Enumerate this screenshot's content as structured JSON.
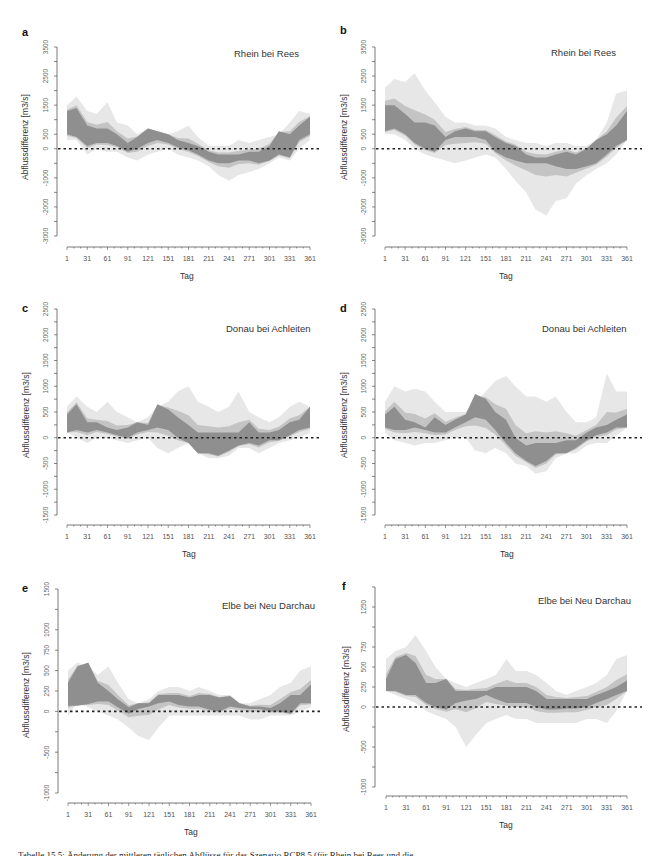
{
  "caption": "Tabelle 15.5: Änderung der mittleren täglichen Abflüsse für das Szenario RCP8.5 (für Rhein bei Rees und die",
  "colors": {
    "light_band": "#e7e7e7",
    "mid_band": "#c4c4c4",
    "dark_band": "#8f8f8f",
    "zero_line": "#222222",
    "axis": "#555555"
  },
  "chart_data": [
    {
      "id": "a",
      "type": "area",
      "title": "Rhein bei Rees",
      "xlabel": "Tag",
      "ylabel": "Abflussdifferenz [m3/s]",
      "xticks": [
        1,
        31,
        61,
        91,
        121,
        151,
        181,
        211,
        241,
        271,
        301,
        331,
        361
      ],
      "yticks": [
        3500,
        2500,
        1500,
        500,
        0,
        -1000,
        -2000,
        -3000
      ],
      "yminor_step": 500,
      "ylim": [
        -3000,
        3500
      ],
      "xlim": [
        1,
        361
      ],
      "reference_line": 0,
      "x": [
        1,
        15,
        31,
        45,
        61,
        75,
        91,
        105,
        121,
        135,
        151,
        165,
        181,
        195,
        211,
        225,
        241,
        255,
        271,
        285,
        301,
        315,
        331,
        345,
        361
      ],
      "light_upper": [
        1500,
        1800,
        1300,
        1200,
        1600,
        900,
        800,
        500,
        700,
        600,
        500,
        600,
        800,
        400,
        100,
        100,
        100,
        300,
        200,
        300,
        400,
        500,
        900,
        1300,
        1200
      ],
      "light_lower": [
        300,
        300,
        -200,
        0,
        -100,
        -100,
        -300,
        -400,
        -200,
        -100,
        0,
        -200,
        -300,
        -400,
        -600,
        -900,
        -1100,
        -900,
        -800,
        -700,
        -500,
        -300,
        -400,
        0,
        300
      ],
      "dark_upper": [
        1300,
        1400,
        800,
        700,
        700,
        500,
        200,
        400,
        700,
        600,
        500,
        300,
        200,
        100,
        -100,
        -200,
        -200,
        -200,
        -100,
        -100,
        100,
        600,
        500,
        800,
        1100
      ],
      "dark_lower": [
        500,
        400,
        100,
        200,
        200,
        100,
        -100,
        0,
        200,
        300,
        200,
        50,
        -50,
        -200,
        -400,
        -500,
        -500,
        -400,
        -400,
        -500,
        -400,
        -200,
        -300,
        300,
        500
      ]
    },
    {
      "id": "b",
      "type": "area",
      "title": "Rhein bei Rees",
      "xlabel": "Tag",
      "ylabel": "Abflussdifferenz [m3/s]",
      "xticks": [
        1,
        31,
        61,
        91,
        121,
        151,
        181,
        211,
        241,
        271,
        301,
        331,
        361
      ],
      "yticks": [
        3500,
        2500,
        1500,
        500,
        0,
        -1000,
        -2000,
        -3000
      ],
      "yminor_step": 500,
      "ylim": [
        -3000,
        3500
      ],
      "xlim": [
        1,
        361
      ],
      "reference_line": 0,
      "x": [
        1,
        15,
        31,
        45,
        61,
        75,
        91,
        105,
        121,
        135,
        151,
        165,
        181,
        195,
        211,
        225,
        241,
        255,
        271,
        285,
        301,
        315,
        331,
        345,
        361
      ],
      "light_upper": [
        2100,
        2400,
        2300,
        2600,
        2000,
        1600,
        1100,
        900,
        900,
        800,
        800,
        700,
        400,
        300,
        200,
        200,
        100,
        200,
        200,
        100,
        100,
        300,
        900,
        1900,
        2000
      ],
      "light_lower": [
        500,
        500,
        300,
        0,
        -200,
        -300,
        -400,
        -500,
        -400,
        -300,
        -200,
        -300,
        -700,
        -1100,
        -1500,
        -2100,
        -2300,
        -1800,
        -1700,
        -1200,
        -900,
        -700,
        -500,
        -200,
        300
      ],
      "dark_upper": [
        1500,
        1500,
        1200,
        900,
        900,
        800,
        400,
        600,
        700,
        600,
        600,
        400,
        200,
        100,
        -200,
        -300,
        -300,
        -200,
        -100,
        -200,
        0,
        300,
        500,
        800,
        1300
      ],
      "dark_lower": [
        600,
        700,
        500,
        200,
        0,
        -100,
        300,
        400,
        400,
        400,
        300,
        -100,
        -300,
        -400,
        -500,
        -500,
        -500,
        -600,
        -700,
        -700,
        -600,
        -500,
        -200,
        100,
        300
      ]
    },
    {
      "id": "c",
      "type": "area",
      "title": "Donau bei Achleiten",
      "xlabel": "Tag",
      "ylabel": "Abflussdifferenz [m3/s]",
      "xticks": [
        1,
        31,
        61,
        91,
        121,
        151,
        181,
        211,
        241,
        271,
        301,
        331,
        361
      ],
      "yticks": [
        2500,
        2000,
        1500,
        1000,
        500,
        0,
        -500,
        -1000,
        -1500
      ],
      "yminor_step": 250,
      "ylim": [
        -1500,
        2500
      ],
      "xlim": [
        1,
        361
      ],
      "reference_line": 0,
      "x": [
        1,
        15,
        31,
        45,
        61,
        75,
        91,
        105,
        121,
        135,
        151,
        165,
        181,
        195,
        211,
        225,
        241,
        255,
        271,
        285,
        301,
        315,
        331,
        345,
        361
      ],
      "light_upper": [
        600,
        800,
        600,
        500,
        700,
        500,
        400,
        300,
        400,
        600,
        700,
        900,
        1000,
        700,
        600,
        500,
        600,
        900,
        500,
        400,
        300,
        400,
        600,
        700,
        600
      ],
      "light_lower": [
        100,
        0,
        -100,
        0,
        0,
        -50,
        -100,
        -50,
        0,
        -200,
        -300,
        -200,
        -100,
        -300,
        -400,
        -400,
        -350,
        -200,
        -200,
        -300,
        -200,
        -100,
        -50,
        0,
        100
      ],
      "dark_upper": [
        450,
        650,
        300,
        300,
        200,
        150,
        200,
        300,
        250,
        650,
        550,
        400,
        250,
        100,
        100,
        100,
        100,
        100,
        300,
        100,
        100,
        150,
        300,
        350,
        600
      ],
      "dark_lower": [
        100,
        150,
        100,
        150,
        100,
        50,
        0,
        100,
        150,
        200,
        150,
        0,
        -100,
        -300,
        -300,
        -350,
        -250,
        -150,
        -100,
        -150,
        -50,
        -50,
        50,
        150,
        200
      ]
    },
    {
      "id": "d",
      "type": "area",
      "title": "Donau bei Achleiten",
      "xlabel": "Tag",
      "ylabel": "Abflussdifferenz [m3/s]",
      "xticks": [
        1,
        31,
        61,
        91,
        121,
        151,
        181,
        211,
        241,
        271,
        301,
        331,
        361
      ],
      "yticks": [
        2500,
        2000,
        1500,
        1000,
        500,
        0,
        -500,
        -1000,
        -1500
      ],
      "yminor_step": 250,
      "ylim": [
        -1500,
        2500
      ],
      "xlim": [
        1,
        361
      ],
      "reference_line": 0,
      "x": [
        1,
        15,
        31,
        45,
        61,
        75,
        91,
        105,
        121,
        135,
        151,
        165,
        181,
        195,
        211,
        225,
        241,
        255,
        271,
        285,
        301,
        315,
        331,
        345,
        361
      ],
      "light_upper": [
        700,
        1000,
        900,
        950,
        900,
        700,
        500,
        500,
        500,
        700,
        900,
        1100,
        1200,
        1000,
        800,
        800,
        700,
        800,
        500,
        300,
        300,
        400,
        1250,
        900,
        900
      ],
      "light_lower": [
        100,
        -50,
        -100,
        -150,
        -100,
        -100,
        -50,
        0,
        0,
        -250,
        -300,
        -200,
        -300,
        -500,
        -550,
        -700,
        -650,
        -400,
        -300,
        -300,
        -150,
        -100,
        -100,
        50,
        200
      ],
      "dark_upper": [
        450,
        600,
        350,
        300,
        200,
        400,
        250,
        350,
        450,
        850,
        750,
        500,
        350,
        0,
        -150,
        -100,
        -100,
        -100,
        -50,
        -50,
        100,
        200,
        250,
        350,
        450
      ],
      "dark_lower": [
        200,
        150,
        150,
        200,
        150,
        100,
        100,
        200,
        300,
        400,
        350,
        150,
        -100,
        -300,
        -450,
        -550,
        -450,
        -300,
        -300,
        -200,
        -50,
        50,
        100,
        200,
        200
      ]
    },
    {
      "id": "e",
      "type": "area",
      "title": "Elbe bei Neu Darchau",
      "xlabel": "Tag",
      "ylabel": "Abflussdifferenz [m3/s]",
      "xticks": [
        1,
        31,
        61,
        91,
        121,
        151,
        181,
        211,
        241,
        271,
        301,
        331,
        361
      ],
      "yticks": [
        1500,
        1000,
        750,
        500,
        250,
        0,
        -500,
        -1000
      ],
      "yminor_step": 250,
      "ylim": [
        -1000,
        1500
      ],
      "xlim": [
        1,
        361
      ],
      "reference_line": 0,
      "x": [
        1,
        15,
        31,
        45,
        61,
        75,
        91,
        105,
        121,
        135,
        151,
        165,
        181,
        195,
        211,
        225,
        241,
        255,
        271,
        285,
        301,
        315,
        331,
        345,
        361
      ],
      "light_upper": [
        500,
        600,
        550,
        450,
        550,
        350,
        150,
        100,
        150,
        250,
        300,
        300,
        250,
        300,
        250,
        200,
        200,
        100,
        100,
        150,
        200,
        300,
        350,
        500,
        550
      ],
      "light_lower": [
        -50,
        100,
        50,
        0,
        -50,
        -100,
        -200,
        -300,
        -350,
        -200,
        -50,
        -50,
        -50,
        -50,
        -50,
        -50,
        -50,
        -50,
        -100,
        -100,
        -50,
        -50,
        -50,
        0,
        50
      ],
      "dark_upper": [
        350,
        550,
        600,
        350,
        250,
        150,
        50,
        100,
        100,
        200,
        200,
        200,
        170,
        200,
        200,
        170,
        190,
        100,
        60,
        60,
        40,
        100,
        200,
        200,
        330
      ],
      "dark_lower": [
        70,
        70,
        90,
        120,
        120,
        50,
        -30,
        30,
        60,
        100,
        120,
        80,
        60,
        60,
        20,
        0,
        60,
        40,
        30,
        30,
        0,
        0,
        -30,
        100,
        100
      ]
    },
    {
      "id": "f",
      "type": "area",
      "title": "Elbe bei Neu Darchau",
      "xlabel": "Tag",
      "ylabel": "Abflussdifferenz [m3/s]",
      "xticks": [
        1,
        31,
        61,
        91,
        121,
        151,
        181,
        211,
        241,
        271,
        301,
        331,
        361
      ],
      "yticks": [
        1250,
        750,
        500,
        250,
        0,
        -500,
        -1000
      ],
      "yminor_step": 250,
      "ylim": [
        -1000,
        1500
      ],
      "xlim": [
        1,
        361
      ],
      "reference_line": 0,
      "x": [
        1,
        15,
        31,
        45,
        61,
        75,
        91,
        105,
        121,
        135,
        151,
        165,
        181,
        195,
        211,
        225,
        241,
        255,
        271,
        285,
        301,
        315,
        331,
        345,
        361
      ],
      "light_upper": [
        600,
        700,
        750,
        900,
        700,
        500,
        350,
        300,
        250,
        300,
        350,
        400,
        600,
        450,
        450,
        400,
        300,
        200,
        150,
        200,
        250,
        300,
        400,
        600,
        650
      ],
      "light_lower": [
        200,
        150,
        100,
        50,
        -50,
        -100,
        -150,
        -250,
        -500,
        -350,
        -200,
        -150,
        -100,
        -150,
        -150,
        -200,
        -200,
        -200,
        -200,
        -200,
        -150,
        -150,
        -200,
        -50,
        200
      ],
      "dark_upper": [
        350,
        600,
        650,
        550,
        300,
        300,
        350,
        200,
        200,
        200,
        200,
        250,
        250,
        250,
        250,
        200,
        100,
        100,
        100,
        100,
        100,
        150,
        200,
        250,
        330
      ],
      "dark_lower": [
        200,
        200,
        150,
        150,
        50,
        0,
        -30,
        50,
        80,
        100,
        150,
        100,
        50,
        50,
        50,
        0,
        -30,
        -30,
        -20,
        -20,
        0,
        50,
        100,
        150,
        200
      ]
    }
  ]
}
